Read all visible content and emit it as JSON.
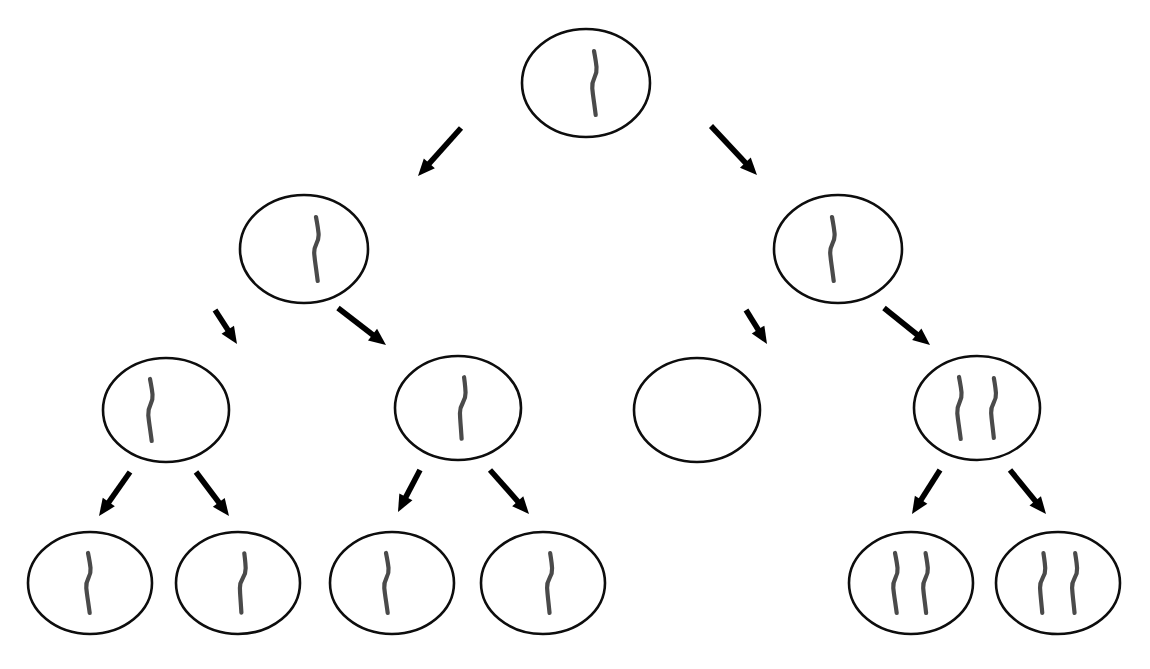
{
  "diagram": {
    "type": "tree",
    "background_color": "#ffffff",
    "node_outline_color": "#0d0d0d",
    "node_fill_color": "#ffffff",
    "node_outline_width": 2.6,
    "stroke_color": "#4a4a4a",
    "arrow_color": "#000000",
    "levels": 4,
    "node_count": 15,
    "arrow_count": 14
  },
  "legend": {
    "stroke_meaning": "hand-drawn tally stroke",
    "empty_meaning": "node with no tally strokes"
  },
  "nodes": [
    {
      "id": "n0",
      "label": "root",
      "level": 0,
      "cx": 586,
      "cy": 83,
      "rx": 64,
      "ry": 54,
      "tally_count": 1,
      "marks": [
        {
          "dx": 8,
          "tilt": 0,
          "len": 64,
          "wobble": 1
        }
      ]
    },
    {
      "id": "n1",
      "label": "level1-left",
      "level": 1,
      "cx": 304,
      "cy": 249,
      "rx": 64,
      "ry": 54,
      "tally_count": 1,
      "marks": [
        {
          "dx": 12,
          "tilt": 0,
          "len": 64,
          "wobble": 1
        }
      ]
    },
    {
      "id": "n2",
      "label": "level1-right",
      "level": 1,
      "cx": 838,
      "cy": 249,
      "rx": 64,
      "ry": 54,
      "tally_count": 1,
      "marks": [
        {
          "dx": -6,
          "tilt": 0,
          "len": 64,
          "wobble": 1
        }
      ]
    },
    {
      "id": "n3",
      "label": "level2-a",
      "level": 2,
      "cx": 166,
      "cy": 410,
      "rx": 63,
      "ry": 52,
      "tally_count": 1,
      "marks": [
        {
          "dx": -16,
          "tilt": 0,
          "len": 62,
          "wobble": 1
        }
      ]
    },
    {
      "id": "n4",
      "label": "level2-b",
      "level": 2,
      "cx": 458,
      "cy": 408,
      "rx": 63,
      "ry": 52,
      "tally_count": 1,
      "marks": [
        {
          "dx": 4,
          "tilt": 7,
          "len": 62,
          "wobble": 1
        }
      ]
    },
    {
      "id": "n5",
      "label": "level2-c-empty",
      "level": 2,
      "cx": 697,
      "cy": 410,
      "rx": 63,
      "ry": 52,
      "tally_count": 0,
      "marks": []
    },
    {
      "id": "n6",
      "label": "level2-d",
      "level": 2,
      "cx": 977,
      "cy": 408,
      "rx": 63,
      "ry": 52,
      "tally_count": 2,
      "marks": [
        {
          "dx": -18,
          "tilt": 0,
          "len": 62,
          "wobble": 1
        },
        {
          "dx": 16,
          "tilt": 3,
          "len": 60,
          "wobble": 1
        }
      ]
    },
    {
      "id": "n7",
      "label": "level3-a",
      "level": 3,
      "cx": 90,
      "cy": 583,
      "rx": 62,
      "ry": 51,
      "tally_count": 1,
      "marks": [
        {
          "dx": -2,
          "tilt": 0,
          "len": 60,
          "wobble": 1
        }
      ]
    },
    {
      "id": "n8",
      "label": "level3-b",
      "level": 3,
      "cx": 238,
      "cy": 583,
      "rx": 62,
      "ry": 51,
      "tally_count": 1,
      "marks": [
        {
          "dx": 4,
          "tilt": 8,
          "len": 60,
          "wobble": 1
        }
      ]
    },
    {
      "id": "n9",
      "label": "level3-c",
      "level": 3,
      "cx": 392,
      "cy": 583,
      "rx": 62,
      "ry": 51,
      "tally_count": 1,
      "marks": [
        {
          "dx": -6,
          "tilt": 0,
          "len": 60,
          "wobble": 1
        }
      ]
    },
    {
      "id": "n10",
      "label": "level3-d",
      "level": 3,
      "cx": 543,
      "cy": 583,
      "rx": 62,
      "ry": 51,
      "tally_count": 1,
      "marks": [
        {
          "dx": 6,
          "tilt": 4,
          "len": 60,
          "wobble": 1
        }
      ]
    },
    {
      "id": "n11",
      "label": "level3-e",
      "level": 3,
      "cx": 911,
      "cy": 583,
      "rx": 62,
      "ry": 51,
      "tally_count": 2,
      "marks": [
        {
          "dx": -16,
          "tilt": 0,
          "len": 60,
          "wobble": 1
        },
        {
          "dx": 14,
          "tilt": 2,
          "len": 60,
          "wobble": 1
        }
      ]
    },
    {
      "id": "n12",
      "label": "level3-f",
      "level": 3,
      "cx": 1058,
      "cy": 583,
      "rx": 62,
      "ry": 51,
      "tally_count": 2,
      "marks": [
        {
          "dx": -16,
          "tilt": 5,
          "len": 60,
          "wobble": 1
        },
        {
          "dx": 16,
          "tilt": 4,
          "len": 60,
          "wobble": 1
        }
      ]
    }
  ],
  "arrows": [
    {
      "id": "a1",
      "from": "n0",
      "to": "n1",
      "x1": 461,
      "y1": 128,
      "x2": 418,
      "y2": 176
    },
    {
      "id": "a2",
      "from": "n0",
      "to": "n2",
      "x1": 711,
      "y1": 126,
      "x2": 757,
      "y2": 175
    },
    {
      "id": "a3",
      "from": "n1",
      "to": "n3",
      "x1": 215,
      "y1": 310,
      "x2": 237,
      "y2": 344
    },
    {
      "id": "a4",
      "from": "n1",
      "to": "n4",
      "x1": 338,
      "y1": 308,
      "x2": 386,
      "y2": 345
    },
    {
      "id": "a5",
      "from": "n2",
      "to": "n5",
      "x1": 746,
      "y1": 310,
      "x2": 767,
      "y2": 344
    },
    {
      "id": "a6",
      "from": "n2",
      "to": "n6",
      "x1": 884,
      "y1": 308,
      "x2": 930,
      "y2": 345
    },
    {
      "id": "a7",
      "from": "n3",
      "to": "n7",
      "x1": 130,
      "y1": 472,
      "x2": 99,
      "y2": 516
    },
    {
      "id": "a8",
      "from": "n3",
      "to": "n8",
      "x1": 196,
      "y1": 472,
      "x2": 229,
      "y2": 516
    },
    {
      "id": "a9",
      "from": "n4",
      "to": "n9",
      "x1": 420,
      "y1": 470,
      "x2": 398,
      "y2": 512
    },
    {
      "id": "a10",
      "from": "n4",
      "to": "n10",
      "x1": 490,
      "y1": 470,
      "x2": 529,
      "y2": 514
    },
    {
      "id": "a11",
      "from": "n6",
      "to": "n11",
      "x1": 940,
      "y1": 470,
      "x2": 912,
      "y2": 514
    },
    {
      "id": "a12",
      "from": "n6",
      "to": "n12",
      "x1": 1010,
      "y1": 470,
      "x2": 1046,
      "y2": 514
    }
  ]
}
